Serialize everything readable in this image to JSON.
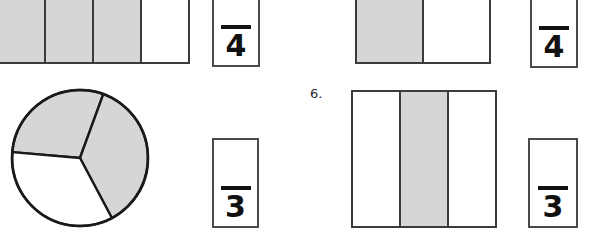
{
  "page": {
    "background_color": "#ffffff",
    "shade_color": "#d6d6d6",
    "line_color": "#3b3b3b",
    "text_color": "#111111",
    "width": 590,
    "height": 240
  },
  "items": [
    {
      "id": "item-top-left",
      "label": "",
      "figure": {
        "type": "bar",
        "parts": 4,
        "shaded": 3,
        "cells": [
          "shaded",
          "shaded",
          "shaded",
          "unshaded"
        ],
        "cropped": "top-and-left"
      },
      "answer": {
        "numerator": "",
        "denominator": "4",
        "fraction_text": "/4"
      }
    },
    {
      "id": "item-top-right",
      "label": "",
      "figure": {
        "type": "bar",
        "parts": 2,
        "shaded": 1,
        "cells": [
          "shaded",
          "unshaded"
        ],
        "cropped": "top"
      },
      "answer": {
        "numerator": "",
        "denominator": "4",
        "fraction_text": "/4"
      }
    },
    {
      "id": "item-bottom-left",
      "label": "",
      "figure": {
        "type": "pie",
        "parts": 3,
        "shaded": 2,
        "sectors": [
          "shaded",
          "shaded",
          "unshaded"
        ],
        "cropped": "none"
      },
      "answer": {
        "numerator": "",
        "denominator": "3",
        "fraction_text": "/3"
      }
    },
    {
      "id": "item-bottom-right",
      "label": "6.",
      "figure": {
        "type": "bar",
        "parts": 3,
        "shaded": 1,
        "cells": [
          "unshaded",
          "shaded",
          "unshaded"
        ],
        "cropped": "none"
      },
      "answer": {
        "numerator": "",
        "denominator": "3",
        "fraction_text": "/3"
      }
    }
  ]
}
